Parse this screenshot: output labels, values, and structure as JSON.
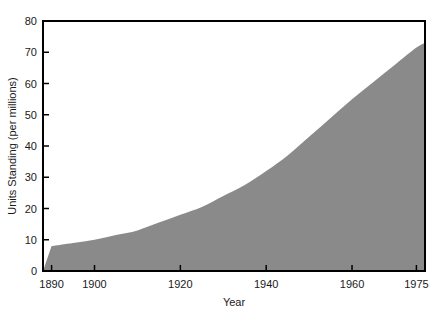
{
  "chart_data": {
    "type": "area",
    "title": "",
    "xlabel": "Year",
    "ylabel": "Units Standing (per millions)",
    "xlim": [
      1888,
      1977
    ],
    "ylim": [
      0,
      80
    ],
    "grid": false,
    "legend": "none",
    "fill_color": "#8a8a8a",
    "line_color": "#8a8a8a",
    "axis_color": "#000000",
    "background_color": "#ffffff",
    "xticks": [
      1890,
      1900,
      1920,
      1940,
      1960,
      1975
    ],
    "xtick_labels": [
      "1890",
      "1900",
      "1920",
      "1940",
      "1960",
      "1975"
    ],
    "yticks": [
      0,
      10,
      20,
      30,
      40,
      50,
      60,
      70,
      80
    ],
    "ytick_labels": [
      "0",
      "10",
      "20",
      "30",
      "40",
      "50",
      "60",
      "70",
      "80"
    ],
    "x": [
      1890,
      1895,
      1900,
      1905,
      1910,
      1915,
      1920,
      1925,
      1930,
      1935,
      1940,
      1945,
      1950,
      1955,
      1960,
      1965,
      1970,
      1975,
      1977
    ],
    "values": [
      8,
      9,
      10,
      11.5,
      13,
      15.5,
      18,
      20.5,
      24,
      27.5,
      32,
      37,
      43,
      49,
      55,
      60.5,
      66,
      71.5,
      73
    ],
    "series": [
      {
        "name": "Units Standing (per millions)",
        "values": [
          8,
          9,
          10,
          11.5,
          13,
          15.5,
          18,
          20.5,
          24,
          27.5,
          32,
          37,
          43,
          49,
          55,
          60.5,
          66,
          71.5,
          73
        ]
      }
    ]
  }
}
